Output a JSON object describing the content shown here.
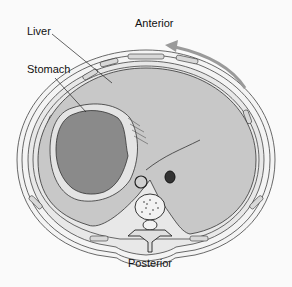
{
  "labels": {
    "liver": "Liver",
    "stomach": "Stomach",
    "anterior": "Anterior",
    "posterior": "Posterior"
  },
  "colors": {
    "background": "#fafafa",
    "organ_fill": "#c8c8c8",
    "stomach_fill": "#8a8a8a",
    "outline": "#333333",
    "arrow": "#9a9a9a"
  }
}
